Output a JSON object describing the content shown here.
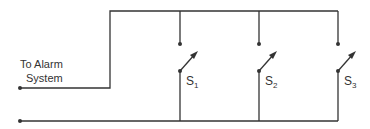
{
  "diagram": {
    "type": "circuit",
    "input_label_line1": "To Alarm",
    "input_label_line2": "System",
    "switches": [
      {
        "name": "S",
        "sub": "1"
      },
      {
        "name": "S",
        "sub": "2"
      },
      {
        "name": "S",
        "sub": "3"
      }
    ],
    "colors": {
      "wire": "#333333",
      "background": "#ffffff"
    }
  }
}
